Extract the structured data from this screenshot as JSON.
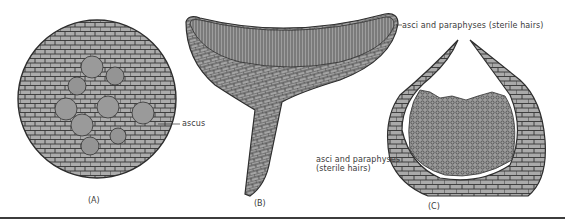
{
  "figure": {
    "panels": [
      {
        "id": "A",
        "label": "(A)",
        "description": "cross-section of ascocarp with asci"
      },
      {
        "id": "B",
        "label": "(B)",
        "description": "cup-shaped apothecium on stalk"
      },
      {
        "id": "C",
        "label": "(C)",
        "description": "flask-shaped ascocarp section"
      }
    ],
    "annotations": {
      "ascus": "ascus",
      "b_asci": "asci and paraphyses (sterile hairs)",
      "c_asci_line1": "asci and paraphyses",
      "c_asci_line2": "(sterile hairs)"
    },
    "colors": {
      "tissue_fill": "#a8a8a8",
      "cell_outline": "#2e2e2e",
      "ascus_fill": "#9a9a9a",
      "background": "#ffffff",
      "text": "#3a3a3a"
    }
  }
}
